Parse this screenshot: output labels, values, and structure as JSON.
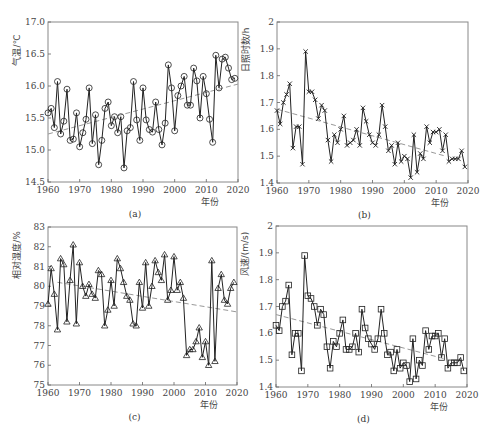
{
  "chart_data": [
    {
      "type": "line",
      "panel": "a",
      "caption": "(a)",
      "title": "",
      "xlabel": "年份",
      "ylabel": "气温/℃",
      "xlim": [
        1960,
        2020
      ],
      "ylim": [
        14.5,
        17.0
      ],
      "xticks": [
        1960,
        1970,
        1980,
        1990,
        2000,
        2010,
        2020
      ],
      "yticks": [
        14.5,
        15.0,
        15.5,
        16.0,
        16.5,
        17.0
      ],
      "ytick_labels": [
        "14.5",
        "15.0",
        "15.5",
        "16.0",
        "16.5",
        "17.0"
      ],
      "marker": "circle",
      "frame": {
        "x0": 48,
        "y0": 22,
        "x1": 238,
        "y1": 182
      },
      "x": [
        1960,
        1961,
        1962,
        1963,
        1964,
        1965,
        1966,
        1967,
        1968,
        1969,
        1970,
        1971,
        1972,
        1973,
        1974,
        1975,
        1976,
        1977,
        1978,
        1979,
        1980,
        1981,
        1982,
        1983,
        1984,
        1985,
        1986,
        1987,
        1988,
        1989,
        1990,
        1991,
        1992,
        1993,
        1994,
        1995,
        1996,
        1997,
        1998,
        1999,
        2000,
        2001,
        2002,
        2003,
        2004,
        2005,
        2006,
        2007,
        2008,
        2009,
        2010,
        2011,
        2012,
        2013,
        2014,
        2015,
        2016,
        2017,
        2018,
        2019
      ],
      "values": [
        15.58,
        15.65,
        15.35,
        16.07,
        15.25,
        15.45,
        15.95,
        15.15,
        15.17,
        15.58,
        15.05,
        15.27,
        15.48,
        15.97,
        15.1,
        15.55,
        14.77,
        15.15,
        15.65,
        15.75,
        15.38,
        15.52,
        15.27,
        15.52,
        14.72,
        15.3,
        15.35,
        16.07,
        15.47,
        15.15,
        15.97,
        15.47,
        15.32,
        15.28,
        15.75,
        15.32,
        15.08,
        15.42,
        16.33,
        15.97,
        15.3,
        15.85,
        16.0,
        16.15,
        15.7,
        15.7,
        16.28,
        16.08,
        15.5,
        16.15,
        15.88,
        15.48,
        15.12,
        16.48,
        15.97,
        16.42,
        16.45,
        16.28,
        16.1,
        16.12
      ],
      "trend": {
        "x": [
          1960,
          2020
        ],
        "y": [
          15.25,
          16.03
        ]
      }
    },
    {
      "type": "line",
      "panel": "b",
      "caption": "(b)",
      "title": "",
      "xlabel": "年份",
      "ylabel": "日照时数/h",
      "xlim": [
        1960,
        2020
      ],
      "ylim": [
        1.4,
        2.0
      ],
      "xticks": [
        1960,
        1970,
        1980,
        1990,
        2000,
        2010,
        2020
      ],
      "yticks": [
        1.4,
        1.5,
        1.6,
        1.7,
        1.8,
        1.9,
        2.0
      ],
      "ytick_labels": [
        "1.4",
        "1.5",
        "1.6",
        "1.7",
        "1.8",
        "1.9",
        "2"
      ],
      "marker": "x",
      "frame": {
        "x0": 277,
        "y0": 22,
        "x1": 468,
        "y1": 183
      },
      "x": [
        1960,
        1961,
        1962,
        1963,
        1964,
        1965,
        1966,
        1967,
        1968,
        1969,
        1970,
        1971,
        1972,
        1973,
        1974,
        1975,
        1976,
        1977,
        1978,
        1979,
        1980,
        1981,
        1982,
        1983,
        1984,
        1985,
        1986,
        1987,
        1988,
        1989,
        1990,
        1991,
        1992,
        1993,
        1994,
        1995,
        1996,
        1997,
        1998,
        1999,
        2000,
        2001,
        2002,
        2003,
        2004,
        2005,
        2006,
        2007,
        2008,
        2009,
        2010,
        2011,
        2012,
        2013,
        2014,
        2015,
        2016,
        2017,
        2018,
        2019
      ],
      "values": [
        1.67,
        1.62,
        1.7,
        1.73,
        1.77,
        1.53,
        1.61,
        1.61,
        1.47,
        1.89,
        1.74,
        1.74,
        1.71,
        1.64,
        1.69,
        1.67,
        1.56,
        1.48,
        1.58,
        1.55,
        1.6,
        1.65,
        1.54,
        1.55,
        1.56,
        1.6,
        1.54,
        1.68,
        1.63,
        1.58,
        1.55,
        1.54,
        1.58,
        1.69,
        1.61,
        1.52,
        1.54,
        1.47,
        1.55,
        1.48,
        1.5,
        1.49,
        1.42,
        1.58,
        1.44,
        1.51,
        1.49,
        1.61,
        1.55,
        1.59,
        1.59,
        1.6,
        1.52,
        1.58,
        1.48,
        1.49,
        1.49,
        1.49,
        1.52,
        1.46
      ],
      "trend": {
        "x": [
          1960,
          2013
        ],
        "y": [
          1.675,
          1.5
        ]
      }
    },
    {
      "type": "line",
      "panel": "c",
      "caption": "(c)",
      "title": "",
      "xlabel": "年份",
      "ylabel": "相对湿度/%",
      "xlim": [
        1960,
        2020
      ],
      "ylim": [
        75,
        83
      ],
      "xticks": [
        1960,
        1970,
        1980,
        1990,
        2000,
        2010,
        2020
      ],
      "yticks": [
        75,
        76,
        77,
        78,
        79,
        80,
        81,
        82,
        83
      ],
      "ytick_labels": [
        "75",
        "76",
        "77",
        "78",
        "79",
        "80",
        "81",
        "82",
        "83"
      ],
      "marker": "triangle",
      "frame": {
        "x0": 48,
        "y0": 227,
        "x1": 237,
        "y1": 385
      },
      "x": [
        1960,
        1961,
        1962,
        1963,
        1964,
        1965,
        1966,
        1967,
        1968,
        1969,
        1970,
        1971,
        1972,
        1973,
        1974,
        1975,
        1976,
        1977,
        1978,
        1979,
        1980,
        1981,
        1982,
        1983,
        1984,
        1985,
        1986,
        1987,
        1988,
        1989,
        1990,
        1991,
        1992,
        1993,
        1994,
        1995,
        1996,
        1997,
        1998,
        1999,
        2000,
        2001,
        2002,
        2003,
        2004,
        2005,
        2006,
        2007,
        2008,
        2009,
        2010,
        2011,
        2012,
        2013,
        2014,
        2015,
        2016,
        2017,
        2018,
        2019
      ],
      "values": [
        79.1,
        80.9,
        79.6,
        77.8,
        81.4,
        81.1,
        78.2,
        80.3,
        82.1,
        78.1,
        81.2,
        80.0,
        79.5,
        80.1,
        79.6,
        79.4,
        80.8,
        80.6,
        78.0,
        78.8,
        80.3,
        79.0,
        81.4,
        80.9,
        80.2,
        79.5,
        79.3,
        78.1,
        78.0,
        80.2,
        78.9,
        81.2,
        79.0,
        80.0,
        81.3,
        80.7,
        80.3,
        81.6,
        79.3,
        79.8,
        81.5,
        79.8,
        80.2,
        79.4,
        76.5,
        76.8,
        76.8,
        77.2,
        77.9,
        76.4,
        77.2,
        76.0,
        81.3,
        76.2,
        79.9,
        80.6,
        79.3,
        79.1,
        79.9,
        80.2
      ],
      "trend": {
        "x": [
          1963,
          2020
        ],
        "y": [
          80.2,
          78.7
        ]
      }
    },
    {
      "type": "line",
      "panel": "d",
      "caption": "(d)",
      "title": "",
      "xlabel": "年份",
      "ylabel": "风速/(m/s)",
      "xlim": [
        1960,
        2020
      ],
      "ylim": [
        1.4,
        2.0
      ],
      "xticks": [
        1960,
        1970,
        1980,
        1990,
        2000,
        2010,
        2020
      ],
      "yticks": [
        1.4,
        1.5,
        1.6,
        1.7,
        1.8,
        1.9,
        2.0
      ],
      "ytick_labels": [
        "1.4",
        "1.5",
        "1.6",
        "1.7",
        "1.8",
        "1.9",
        "2"
      ],
      "marker": "square",
      "frame": {
        "x0": 276,
        "y0": 226,
        "x1": 467,
        "y1": 387
      },
      "x": [
        1960,
        1961,
        1962,
        1963,
        1964,
        1965,
        1966,
        1967,
        1968,
        1969,
        1970,
        1971,
        1972,
        1973,
        1974,
        1975,
        1976,
        1977,
        1978,
        1979,
        1980,
        1981,
        1982,
        1983,
        1984,
        1985,
        1986,
        1987,
        1988,
        1989,
        1990,
        1991,
        1992,
        1993,
        1994,
        1995,
        1996,
        1997,
        1998,
        1999,
        2000,
        2001,
        2002,
        2003,
        2004,
        2005,
        2006,
        2007,
        2008,
        2009,
        2010,
        2011,
        2012,
        2013,
        2014,
        2015,
        2016,
        2017,
        2018,
        2019
      ],
      "values": [
        1.63,
        1.61,
        1.7,
        1.72,
        1.78,
        1.52,
        1.6,
        1.6,
        1.46,
        1.89,
        1.74,
        1.73,
        1.7,
        1.63,
        1.69,
        1.67,
        1.55,
        1.47,
        1.57,
        1.55,
        1.6,
        1.65,
        1.54,
        1.54,
        1.55,
        1.6,
        1.53,
        1.69,
        1.62,
        1.58,
        1.56,
        1.54,
        1.58,
        1.69,
        1.6,
        1.52,
        1.53,
        1.46,
        1.54,
        1.47,
        1.49,
        1.48,
        1.42,
        1.58,
        1.43,
        1.5,
        1.48,
        1.61,
        1.54,
        1.59,
        1.59,
        1.6,
        1.51,
        1.58,
        1.47,
        1.49,
        1.49,
        1.49,
        1.51,
        1.46
      ],
      "trend": {
        "x": [
          1960,
          2013
        ],
        "y": [
          1.67,
          1.505
        ]
      }
    }
  ]
}
